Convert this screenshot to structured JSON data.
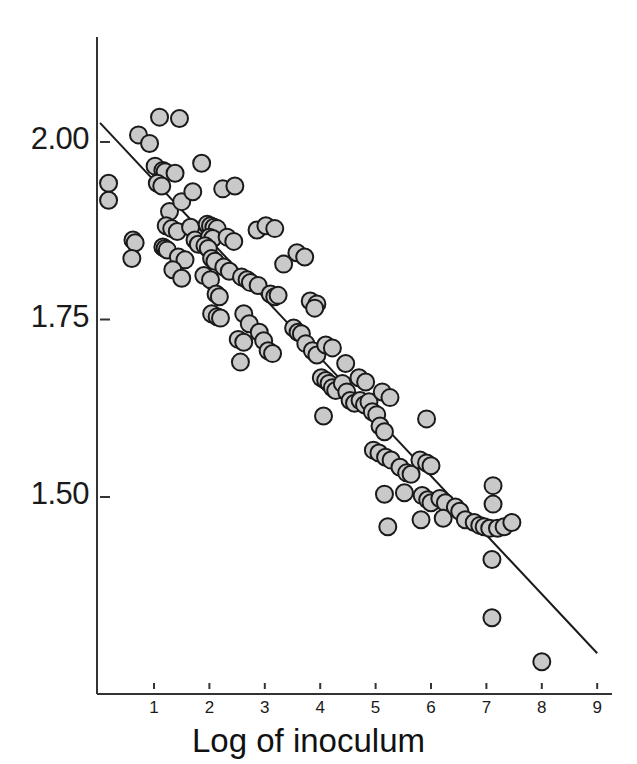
{
  "chart_data": {
    "type": "scatter",
    "title": "",
    "subtitle": "",
    "xlabel": "Log of inoculum",
    "ylabel": "",
    "xlim": [
      0.0,
      9.05
    ],
    "ylim": [
      1.262,
      2.072
    ],
    "grid": false,
    "legend": null,
    "xticks": [
      1,
      2,
      3,
      4,
      5,
      6,
      7,
      8,
      9
    ],
    "xtick_labels": [
      "1",
      "2",
      "3",
      "4",
      "5",
      "6",
      "7",
      "8",
      "9"
    ],
    "yticks": [
      1.5,
      1.75,
      2.0
    ],
    "ytick_labels": [
      "1.50",
      "1.75",
      "2.00"
    ],
    "marker": {
      "shape": "circle",
      "fill": "#c9c9c9",
      "edge": "#1a1a1a",
      "diameter_px": 17,
      "edge_width_px": 2
    },
    "axis_color": "#333333",
    "fit_line": {
      "label": "regression line",
      "color": "#1a1a1a",
      "width_px": 2,
      "x0": 0.025,
      "y0": 2.027,
      "x1": 9.0,
      "y1": 1.28,
      "slope": -0.0833,
      "intercept": 2.0291
    },
    "points": [
      [
        0.18,
        1.942
      ],
      [
        0.18,
        1.918
      ],
      [
        0.62,
        1.862
      ],
      [
        0.66,
        1.858
      ],
      [
        0.6,
        1.836
      ],
      [
        0.72,
        2.01
      ],
      [
        0.92,
        1.998
      ],
      [
        1.1,
        2.035
      ],
      [
        1.46,
        2.033
      ],
      [
        1.02,
        1.966
      ],
      [
        1.1,
        1.944
      ],
      [
        1.16,
        1.96
      ],
      [
        1.2,
        1.958
      ],
      [
        1.06,
        1.942
      ],
      [
        1.14,
        1.938
      ],
      [
        1.28,
        1.902
      ],
      [
        1.38,
        1.956
      ],
      [
        1.5,
        1.916
      ],
      [
        1.22,
        1.882
      ],
      [
        1.32,
        1.878
      ],
      [
        1.42,
        1.874
      ],
      [
        1.16,
        1.852
      ],
      [
        1.2,
        1.85
      ],
      [
        1.24,
        1.848
      ],
      [
        1.44,
        1.838
      ],
      [
        1.56,
        1.834
      ],
      [
        1.34,
        1.82
      ],
      [
        1.5,
        1.808
      ],
      [
        1.66,
        1.88
      ],
      [
        1.74,
        1.862
      ],
      [
        1.8,
        1.856
      ],
      [
        1.86,
        1.97
      ],
      [
        1.7,
        1.93
      ],
      [
        1.96,
        1.884
      ],
      [
        2.02,
        1.882
      ],
      [
        2.08,
        1.88
      ],
      [
        2.14,
        1.878
      ],
      [
        2.0,
        1.866
      ],
      [
        2.06,
        1.864
      ],
      [
        1.92,
        1.854
      ],
      [
        1.98,
        1.85
      ],
      [
        2.04,
        1.836
      ],
      [
        2.1,
        1.832
      ],
      [
        1.9,
        1.812
      ],
      [
        2.02,
        1.806
      ],
      [
        2.24,
        1.934
      ],
      [
        2.46,
        1.938
      ],
      [
        2.32,
        1.866
      ],
      [
        2.44,
        1.86
      ],
      [
        2.26,
        1.824
      ],
      [
        2.36,
        1.818
      ],
      [
        2.12,
        1.786
      ],
      [
        2.18,
        1.782
      ],
      [
        2.04,
        1.758
      ],
      [
        2.14,
        1.754
      ],
      [
        2.2,
        1.752
      ],
      [
        2.58,
        1.81
      ],
      [
        2.68,
        1.806
      ],
      [
        2.74,
        1.802
      ],
      [
        2.88,
        1.798
      ],
      [
        2.62,
        1.758
      ],
      [
        2.72,
        1.744
      ],
      [
        2.52,
        1.722
      ],
      [
        2.62,
        1.718
      ],
      [
        2.56,
        1.69
      ],
      [
        2.86,
        1.876
      ],
      [
        3.02,
        1.882
      ],
      [
        3.18,
        1.878
      ],
      [
        3.1,
        1.786
      ],
      [
        3.18,
        1.782
      ],
      [
        3.24,
        1.784
      ],
      [
        3.34,
        1.828
      ],
      [
        2.9,
        1.732
      ],
      [
        2.98,
        1.72
      ],
      [
        3.06,
        1.706
      ],
      [
        3.14,
        1.702
      ],
      [
        3.58,
        1.844
      ],
      [
        3.72,
        1.838
      ],
      [
        3.52,
        1.738
      ],
      [
        3.6,
        1.732
      ],
      [
        3.66,
        1.73
      ],
      [
        3.74,
        1.716
      ],
      [
        3.82,
        1.776
      ],
      [
        3.94,
        1.772
      ],
      [
        3.9,
        1.766
      ],
      [
        3.86,
        1.706
      ],
      [
        3.94,
        1.7
      ],
      [
        4.1,
        1.714
      ],
      [
        4.22,
        1.71
      ],
      [
        4.02,
        1.668
      ],
      [
        4.1,
        1.664
      ],
      [
        4.16,
        1.66
      ],
      [
        4.22,
        1.654
      ],
      [
        4.28,
        1.65
      ],
      [
        4.06,
        1.614
      ],
      [
        4.4,
        1.66
      ],
      [
        4.48,
        1.648
      ],
      [
        4.54,
        1.636
      ],
      [
        4.62,
        1.632
      ],
      [
        4.46,
        1.688
      ],
      [
        4.7,
        1.668
      ],
      [
        4.82,
        1.662
      ],
      [
        4.72,
        1.636
      ],
      [
        4.8,
        1.63
      ],
      [
        4.88,
        1.634
      ],
      [
        4.94,
        1.62
      ],
      [
        5.02,
        1.616
      ],
      [
        5.12,
        1.648
      ],
      [
        5.26,
        1.64
      ],
      [
        5.08,
        1.6
      ],
      [
        5.16,
        1.592
      ],
      [
        4.96,
        1.566
      ],
      [
        5.06,
        1.562
      ],
      [
        5.18,
        1.556
      ],
      [
        5.28,
        1.552
      ],
      [
        5.16,
        1.504
      ],
      [
        5.22,
        1.458
      ],
      [
        5.44,
        1.542
      ],
      [
        5.56,
        1.534
      ],
      [
        5.64,
        1.532
      ],
      [
        5.52,
        1.506
      ],
      [
        5.92,
        1.61
      ],
      [
        5.8,
        1.552
      ],
      [
        5.92,
        1.548
      ],
      [
        6.0,
        1.544
      ],
      [
        5.84,
        1.502
      ],
      [
        5.94,
        1.496
      ],
      [
        6.0,
        1.492
      ],
      [
        5.82,
        1.468
      ],
      [
        6.16,
        1.498
      ],
      [
        6.26,
        1.492
      ],
      [
        6.22,
        1.47
      ],
      [
        6.44,
        1.486
      ],
      [
        6.52,
        1.48
      ],
      [
        6.62,
        1.468
      ],
      [
        6.78,
        1.464
      ],
      [
        6.88,
        1.46
      ],
      [
        6.96,
        1.458
      ],
      [
        7.06,
        1.456
      ],
      [
        7.12,
        1.516
      ],
      [
        7.12,
        1.49
      ],
      [
        7.2,
        1.456
      ],
      [
        7.32,
        1.458
      ],
      [
        7.46,
        1.464
      ],
      [
        7.1,
        1.412
      ],
      [
        7.1,
        1.33
      ],
      [
        8.0,
        1.268
      ]
    ]
  }
}
